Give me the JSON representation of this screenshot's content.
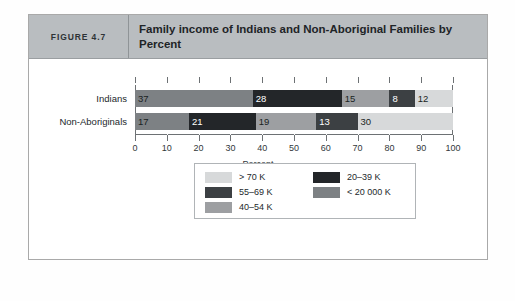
{
  "figure": {
    "number_label": "FIGURE 4.7",
    "title": "Family income of Indians and Non-Aboriginal Families by Percent"
  },
  "chart_data": {
    "type": "bar",
    "orientation": "horizontal",
    "stacked": true,
    "title": "Family income of Indians and Non-Aboriginal Families by Percent",
    "xlabel": "Percent",
    "ylabel": "",
    "xlim": [
      0,
      100
    ],
    "xticks": [
      0,
      10,
      20,
      30,
      40,
      50,
      60,
      70,
      80,
      90,
      100
    ],
    "xtick_labels": [
      "0",
      "10",
      "20",
      "30",
      "40",
      "50",
      "60",
      "70",
      "80",
      "90",
      "100"
    ],
    "grid": true,
    "legend_position": "bottom-center",
    "categories": [
      "Indians",
      "Non-Aboriginals"
    ],
    "series": [
      {
        "name": "< 20 000 K",
        "color": "#7d8184",
        "text_color": "#1a1f22",
        "values": [
          37,
          17
        ]
      },
      {
        "name": "20–39 K",
        "color": "#232629",
        "text_color": "#ffffff",
        "values": [
          28,
          21
        ]
      },
      {
        "name": "40–54 K",
        "color": "#9d9fa2",
        "text_color": "#1a1f22",
        "values": [
          15,
          19
        ]
      },
      {
        "name": "55–69 K",
        "color": "#3c4043",
        "text_color": "#ffffff",
        "values": [
          8,
          13
        ]
      },
      {
        "name": "> 70 K",
        "color": "#d7d9da",
        "text_color": "#1a1f22",
        "values": [
          12,
          30
        ]
      }
    ],
    "bars": [
      {
        "label": "Indians",
        "segments": [
          {
            "series": "< 20 000 K",
            "value": 37,
            "value_label": "37"
          },
          {
            "series": "20–39 K",
            "value": 28,
            "value_label": "28"
          },
          {
            "series": "40–54 K",
            "value": 15,
            "value_label": "15"
          },
          {
            "series": "55–69 K",
            "value": 8,
            "value_label": "8"
          },
          {
            "series": "> 70 K",
            "value": 12,
            "value_label": "12"
          }
        ]
      },
      {
        "label": "Non-Aboriginals",
        "segments": [
          {
            "series": "< 20 000 K",
            "value": 17,
            "value_label": "17"
          },
          {
            "series": "20–39 K",
            "value": 21,
            "value_label": "21"
          },
          {
            "series": "40–54 K",
            "value": 19,
            "value_label": "19"
          },
          {
            "series": "55–69 K",
            "value": 13,
            "value_label": "13"
          },
          {
            "series": "> 70 K",
            "value": 30,
            "value_label": "30"
          }
        ]
      }
    ],
    "legend": {
      "left_column": [
        {
          "label": "> 70 K",
          "color": "#d7d9da"
        },
        {
          "label": "55–69 K",
          "color": "#3c4043"
        },
        {
          "label": "40–54 K",
          "color": "#9d9fa2"
        }
      ],
      "right_column": [
        {
          "label": "20–39 K",
          "color": "#232629"
        },
        {
          "label": "< 20 000 K",
          "color": "#7d8184"
        }
      ]
    }
  },
  "colors": {
    "header_band": "#b9bdc0",
    "frame_border": "#a9a9a9",
    "axis_line": "#6d7174"
  }
}
